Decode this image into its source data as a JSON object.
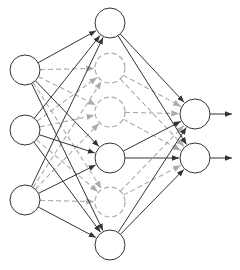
{
  "diagram": {
    "type": "neural-network-dropout",
    "colors": {
      "solid": "#333333",
      "dropped": "#aaaaaa",
      "background": "#ffffff"
    },
    "node_radius": 15,
    "layers": [
      {
        "name": "input",
        "nodes": [
          {
            "x": 25,
            "y": 70,
            "active": true
          },
          {
            "x": 25,
            "y": 130,
            "active": true
          },
          {
            "x": 25,
            "y": 200,
            "active": true
          }
        ]
      },
      {
        "name": "hidden",
        "nodes": [
          {
            "x": 110,
            "y": 23,
            "active": true
          },
          {
            "x": 110,
            "y": 68,
            "active": false
          },
          {
            "x": 110,
            "y": 112,
            "active": false
          },
          {
            "x": 110,
            "y": 158,
            "active": true
          },
          {
            "x": 110,
            "y": 202,
            "active": false
          },
          {
            "x": 110,
            "y": 245,
            "active": true
          }
        ]
      },
      {
        "name": "output",
        "nodes": [
          {
            "x": 195,
            "y": 114,
            "active": true
          },
          {
            "x": 195,
            "y": 158,
            "active": true
          }
        ]
      }
    ],
    "output_arrow_end_x": 232
  }
}
